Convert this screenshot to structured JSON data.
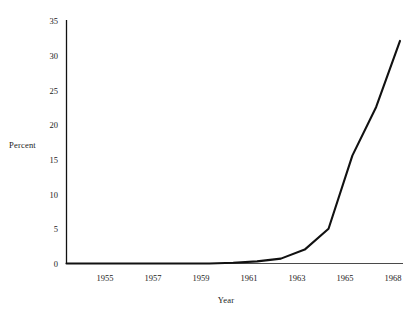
{
  "chart_data": {
    "type": "line",
    "title": "",
    "xlabel": "Year",
    "ylabel": "Percent",
    "xlim": [
      1954,
      1968
    ],
    "ylim": [
      0,
      35
    ],
    "grid": false,
    "legend": null,
    "x_tick_labels": [
      "1955",
      "1957",
      "1959",
      "1961",
      "1963",
      "1965",
      "1968"
    ],
    "x_tick_values": [
      1955,
      1957,
      1959,
      1961,
      1963,
      1965,
      1968
    ],
    "y_tick_labels": [
      "0",
      "5",
      "10",
      "15",
      "20",
      "25",
      "30",
      "35"
    ],
    "y_tick_values": [
      0,
      5,
      10,
      15,
      20,
      25,
      30,
      35
    ],
    "series": [
      {
        "name": "Percent",
        "color": "#111111",
        "x": [
          1954,
          1955,
          1956,
          1957,
          1958,
          1959,
          1960,
          1961,
          1962,
          1963,
          1964,
          1965,
          1966,
          1967,
          1968
        ],
        "values": [
          0,
          0,
          0,
          0,
          0,
          0,
          0,
          0.1,
          0.3,
          0.7,
          2.0,
          5.0,
          15.5,
          22.5,
          32.0
        ]
      }
    ]
  },
  "axes": {
    "ylabel": "Percent",
    "xlabel": "Year"
  }
}
